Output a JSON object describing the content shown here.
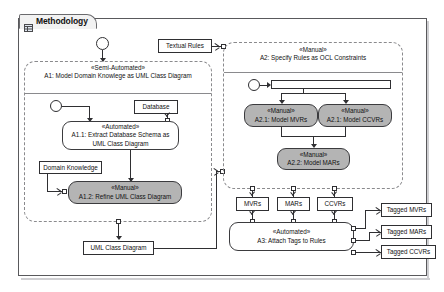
{
  "window": {
    "tab_title": "Methodology",
    "tab_icon": "diagram-grid-icon"
  },
  "diagram": {
    "type": "uml-activity-diagram",
    "partitions": [
      {
        "id": "A1",
        "stereotype": "«Semi-Automated»",
        "name": "A1: Model Domain Knowlege as UML Class Diagram"
      },
      {
        "id": "A2",
        "stereotype": "«Manual»",
        "name": "A2: Specify Rules as OCL Constraints"
      }
    ],
    "actions": [
      {
        "id": "A1.1",
        "stereotype": "«Automated»",
        "name": "A1.1: Extract Database Schema as UML Class Diagram",
        "shaded": false
      },
      {
        "id": "A1.2",
        "stereotype": "«Manual»",
        "name": "A1.2: Refine UML Class Diagram",
        "shaded": true
      },
      {
        "id": "A2.1a",
        "stereotype": "«Manual»",
        "name": "A2.1: Model MVRs",
        "shaded": true
      },
      {
        "id": "A2.1b",
        "stereotype": "«Manual»",
        "name": "A2.1: Model CCVRs",
        "shaded": true
      },
      {
        "id": "A2.2",
        "stereotype": "«Manual»",
        "name": "A2.2: Model MARs",
        "shaded": true
      },
      {
        "id": "A3",
        "stereotype": "«Automated»",
        "name": "A3: Attach Tags to Rules",
        "shaded": false
      }
    ],
    "objects": [
      {
        "id": "textual-rules",
        "label": "Textual Rules"
      },
      {
        "id": "database",
        "label": "Database"
      },
      {
        "id": "domain-knowledge",
        "label": "Domain Knowledge"
      },
      {
        "id": "uml-class-diagram",
        "label": "UML Class Diagram"
      },
      {
        "id": "mvrs",
        "label": "MVRs"
      },
      {
        "id": "mars",
        "label": "MARs"
      },
      {
        "id": "ccvrs",
        "label": "CCVRs"
      },
      {
        "id": "tagged-mvrs",
        "label": "Tagged MVRs"
      },
      {
        "id": "tagged-mars",
        "label": "Tagged MARs"
      },
      {
        "id": "tagged-ccvrs",
        "label": "Tagged CCVRs"
      }
    ],
    "colors": {
      "shaded_node_fill": "#b4b4b4",
      "node_stroke": "#3b3b3e",
      "partition_stroke": "#8a8a8d",
      "frame_stroke": "#59595c",
      "canvas": "#ffffff"
    }
  }
}
